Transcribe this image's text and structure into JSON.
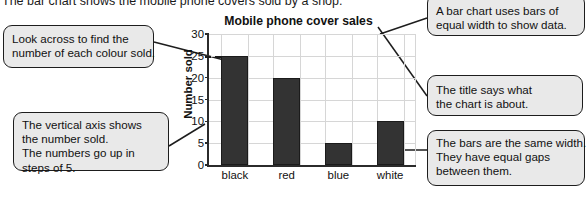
{
  "intro": {
    "text": "The bar chart shows the mobile phone covers sold by a shop."
  },
  "callouts": {
    "look_across": {
      "name": "callout-look-across",
      "lines": [
        "Look across to find the",
        "number of each colour sold."
      ]
    },
    "vertical_axis": {
      "name": "callout-vertical-axis",
      "lines": [
        "The vertical axis shows",
        "the number sold.",
        "The numbers go up in",
        "steps of 5."
      ]
    },
    "equal_bars": {
      "name": "callout-equal-bars",
      "lines": [
        "A bar chart uses bars of",
        "equal width to show data."
      ]
    },
    "title_info": {
      "name": "callout-title-info",
      "lines": [
        "The title says what",
        "the chart is about."
      ]
    },
    "same_width": {
      "name": "callout-same-width",
      "lines": [
        "The bars are the same width.",
        "They have equal gaps",
        "between them."
      ]
    }
  },
  "chart_data": {
    "type": "bar",
    "title": "Mobile phone cover sales",
    "xlabel": "",
    "ylabel": "Number sold",
    "categories": [
      "black",
      "red",
      "blue",
      "white"
    ],
    "values": [
      25,
      20,
      5,
      10
    ],
    "yticks": [
      0,
      5,
      10,
      15,
      20,
      25,
      30
    ],
    "ylim": [
      0,
      30
    ],
    "grid": true,
    "legend": "none",
    "bar_color": "#333333",
    "gridline_color": "#d6d6d6",
    "axis_color": "#2b2b2b",
    "annotations": [
      {
        "name": "dashed-reader-line",
        "value": 25,
        "category": "black"
      }
    ]
  },
  "colors": {
    "callout_bg": "#e9e9e9",
    "callout_border": "#1d1d1d",
    "text": "#111111",
    "background": "#ffffff"
  }
}
